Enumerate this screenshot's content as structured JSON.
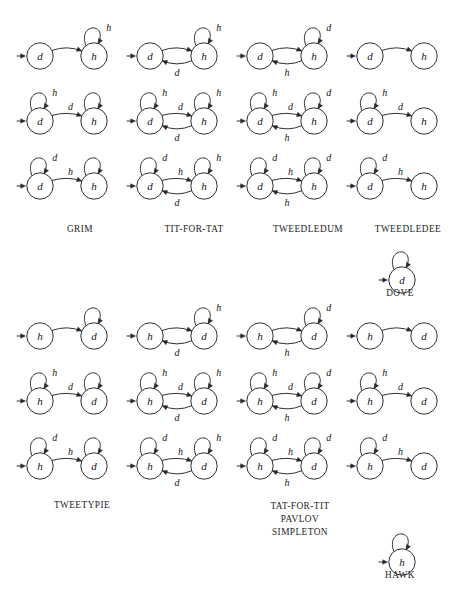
{
  "figure": {
    "node_labels": {
      "d": "d",
      "h": "h"
    },
    "edge_labels": {
      "d": "d",
      "h": "h"
    }
  },
  "captions": {
    "grim": "GRIM",
    "tit_for_tat": "TIT-FOR-TAT",
    "tweedledum": "TWEEDLEDUM",
    "tweedledee": "TWEEDLEDEE",
    "dove": "DOVE",
    "tweetypie": "TWEETYPIE",
    "tat_for_tit": "TAT-FOR-TIT",
    "pavlov": "PAVLOV",
    "simpleton": "SIMPLETON",
    "hawk": "HAWK"
  },
  "panels": {
    "top": {
      "start_state": "d",
      "second_state": "h",
      "rows": [
        {
          "row": 1,
          "cells": [
            {
              "id": "t-r1-c1",
              "left_self": null,
              "right_self": "h",
              "forward": null,
              "back": null
            },
            {
              "id": "t-r1-c2",
              "left_self": null,
              "right_self": "h",
              "forward": null,
              "back": "d"
            },
            {
              "id": "t-r1-c3",
              "left_self": null,
              "right_self": "d",
              "forward": null,
              "back": "h"
            },
            {
              "id": "t-r1-c4",
              "left_self": null,
              "right_self": null,
              "forward": null,
              "back": null
            }
          ]
        },
        {
          "row": 2,
          "cells": [
            {
              "id": "t-r2-c1",
              "left_self": "h",
              "right_self": "",
              "forward": "d",
              "back": null
            },
            {
              "id": "t-r2-c2",
              "left_self": "h",
              "right_self": "h",
              "forward": "d",
              "back": "d"
            },
            {
              "id": "t-r2-c3",
              "left_self": "h",
              "right_self": "d",
              "forward": "d",
              "back": "h"
            },
            {
              "id": "t-r2-c4",
              "left_self": "h",
              "right_self": null,
              "forward": "d",
              "back": null
            }
          ]
        },
        {
          "row": 3,
          "cells": [
            {
              "id": "t-r3-c1",
              "left_self": "d",
              "right_self": "",
              "forward": "h",
              "back": null
            },
            {
              "id": "t-r3-c2",
              "left_self": "d",
              "right_self": "h",
              "forward": "h",
              "back": "d"
            },
            {
              "id": "t-r3-c3",
              "left_self": "d",
              "right_self": "d",
              "forward": "h",
              "back": "h"
            },
            {
              "id": "t-r3-c4",
              "left_self": "d",
              "right_self": null,
              "forward": "h",
              "back": null
            }
          ]
        }
      ],
      "dove": {
        "id": "t-dove",
        "state": "d",
        "self_loop": ""
      }
    },
    "bottom": {
      "start_state": "h",
      "second_state": "d",
      "rows": [
        {
          "row": 1,
          "cells": [
            {
              "id": "b-r1-c1",
              "left_self": null,
              "right_self": "",
              "forward": null,
              "back": null
            },
            {
              "id": "b-r1-c2",
              "left_self": null,
              "right_self": "h",
              "forward": null,
              "back": "d"
            },
            {
              "id": "b-r1-c3",
              "left_self": null,
              "right_self": "d",
              "forward": null,
              "back": "h"
            },
            {
              "id": "b-r1-c4",
              "left_self": null,
              "right_self": null,
              "forward": null,
              "back": null
            }
          ]
        },
        {
          "row": 2,
          "cells": [
            {
              "id": "b-r2-c1",
              "left_self": "h",
              "right_self": "",
              "forward": "d",
              "back": null
            },
            {
              "id": "b-r2-c2",
              "left_self": "h",
              "right_self": "h",
              "forward": "d",
              "back": "d"
            },
            {
              "id": "b-r2-c3",
              "left_self": "h",
              "right_self": "d",
              "forward": "d",
              "back": "h"
            },
            {
              "id": "b-r2-c4",
              "left_self": "h",
              "right_self": null,
              "forward": "d",
              "back": null
            }
          ]
        },
        {
          "row": 3,
          "cells": [
            {
              "id": "b-r3-c1",
              "left_self": "d",
              "right_self": "",
              "forward": "h",
              "back": null
            },
            {
              "id": "b-r3-c2",
              "left_self": "d",
              "right_self": "h",
              "forward": "h",
              "back": "d"
            },
            {
              "id": "b-r3-c3",
              "left_self": "d",
              "right_self": "d",
              "forward": "h",
              "back": "h"
            },
            {
              "id": "b-r3-c4",
              "left_self": "d",
              "right_self": null,
              "forward": "h",
              "back": null
            }
          ]
        }
      ],
      "hawk": {
        "id": "b-hawk",
        "state": "h",
        "self_loop": ""
      }
    }
  },
  "colors": {
    "background": "#ffffff",
    "ink": "#26262b",
    "text": "#15151a"
  }
}
